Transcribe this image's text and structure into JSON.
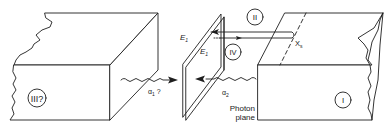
{
  "figure": {
    "regions": [
      {
        "id": "I",
        "label": "I"
      },
      {
        "id": "II",
        "label": "II"
      },
      {
        "id": "III",
        "label": "III?"
      },
      {
        "id": "IV",
        "label": "IV"
      }
    ],
    "labels": {
      "e1_outer": "E",
      "e1_outer_sub": "1",
      "e1_inner": "E",
      "e1_inner_sub": "1",
      "alpha1": "α",
      "alpha1_sub": "1",
      "alpha1_suffix": " ?",
      "alpha2": "α",
      "alpha2_sub": "2",
      "xs": "X",
      "xs_sub": "s",
      "photon_plane_line1": "Photon",
      "photon_plane_line2": "plane"
    },
    "colors": {
      "line": "#1e1e1e",
      "background": "#ffffff"
    }
  }
}
